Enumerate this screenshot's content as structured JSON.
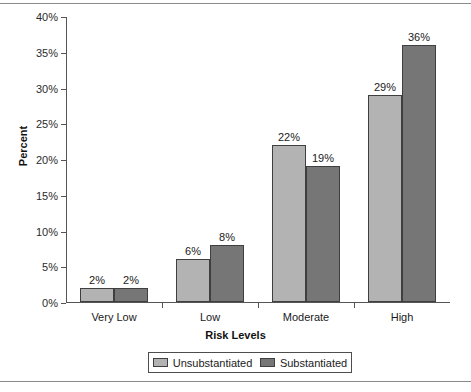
{
  "colors": {
    "series_light": "#b3b3b3",
    "series_dark": "#767676",
    "axis": "#555555",
    "text": "#1a1a1a"
  },
  "axis_titles": {
    "y": "Percent",
    "x": "Risk Levels"
  },
  "legend": {
    "items": [
      {
        "label": "Unsubstantiated",
        "color": "#b3b3b3"
      },
      {
        "label": "Substantiated",
        "color": "#767676"
      }
    ]
  },
  "chart_data": {
    "type": "bar",
    "title": "",
    "subtitle": "",
    "xlabel": "Risk Levels",
    "ylabel": "Percent",
    "categories": [
      "Very Low",
      "Low",
      "Moderate",
      "High"
    ],
    "series": [
      {
        "name": "Unsubstantiated",
        "values": [
          2,
          6,
          22,
          29
        ],
        "color": "#b3b3b3"
      },
      {
        "name": "Substantiated",
        "values": [
          2,
          8,
          19,
          36
        ],
        "color": "#767676"
      }
    ],
    "value_labels": [
      [
        "2%",
        "2%"
      ],
      [
        "6%",
        "8%"
      ],
      [
        "22%",
        "19%"
      ],
      [
        "29%",
        "36%"
      ]
    ],
    "ylim": [
      0,
      40
    ],
    "ytick_values": [
      0,
      5,
      10,
      15,
      20,
      25,
      30,
      35,
      40
    ],
    "ytick_labels": [
      "0%",
      "5%",
      "10%",
      "15%",
      "20%",
      "25%",
      "30%",
      "35%",
      "40%"
    ],
    "grid": false,
    "legend_position": "bottom",
    "units": "percent"
  }
}
